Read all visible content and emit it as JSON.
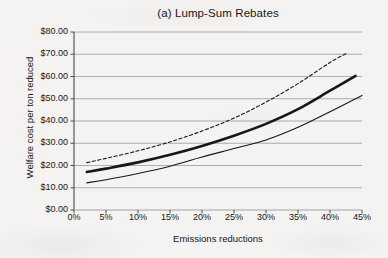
{
  "figure": {
    "title": "(a) Lump-Sum Rebates",
    "background_color": "#f4f3f1",
    "ink_color": "#16171a",
    "gridline_color": "#9a9a9a"
  },
  "axes": {
    "x_title": "Emissions reductions",
    "y_title": "Welfare cost per ton reduced",
    "x_tick_labels": [
      "0%",
      "5%",
      "10%",
      "15%",
      "20%",
      "25%",
      "30%",
      "35%",
      "40%",
      "45%"
    ],
    "y_tick_labels": [
      "$0.00",
      "$10.00",
      "$20.00",
      "$30.00",
      "$40.00",
      "$50.00",
      "$60.00",
      "$70.00",
      "$80.00"
    ]
  },
  "chart_data": {
    "type": "line",
    "title": "(a) Lump-Sum Rebates",
    "xlabel": "Emissions reductions",
    "ylabel": "Welfare cost per ton reduced",
    "xlim": [
      0,
      45
    ],
    "ylim": [
      0,
      80
    ],
    "x_tick_values": [
      0,
      5,
      10,
      15,
      20,
      25,
      30,
      35,
      40,
      45
    ],
    "y_tick_values": [
      0,
      10,
      20,
      30,
      40,
      50,
      60,
      70,
      80
    ],
    "x_unit": "percent",
    "y_unit": "dollars per ton",
    "grid": "horizontal",
    "legend": "none",
    "series": [
      {
        "name": "upper-dashed",
        "style": "dashed",
        "width": 1.1,
        "color": "#16171a",
        "x": [
          2,
          5,
          10,
          15,
          20,
          25,
          30,
          35,
          40,
          42.5
        ],
        "values": [
          21.3,
          23.2,
          26.6,
          30.6,
          35.5,
          41.3,
          48.5,
          56.8,
          66.3,
          70.3
        ]
      },
      {
        "name": "middle-thick-solid",
        "style": "solid",
        "width": 2.6,
        "color": "#16171a",
        "x": [
          2,
          5,
          10,
          15,
          20,
          25,
          30,
          35,
          40,
          44
        ],
        "values": [
          17.1,
          18.6,
          21.4,
          24.8,
          28.8,
          33.4,
          38.7,
          45.3,
          53.6,
          60.3
        ]
      },
      {
        "name": "lower-thin-solid",
        "style": "solid",
        "width": 1.1,
        "color": "#16171a",
        "x": [
          2,
          5,
          10,
          15,
          20,
          25,
          30,
          35,
          40,
          45
        ],
        "values": [
          12.2,
          13.6,
          16.4,
          19.7,
          23.8,
          27.6,
          31.5,
          37.2,
          44.2,
          51.5
        ]
      }
    ]
  }
}
